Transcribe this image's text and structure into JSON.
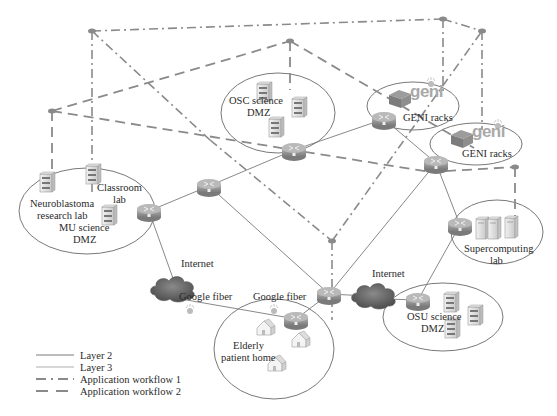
{
  "diagram": {
    "sites": {
      "osc": {
        "line1": "OSC science",
        "line2": "DMZ"
      },
      "geni_top": {
        "label": "GENI racks",
        "logo": "geni"
      },
      "geni_right": {
        "label": "GENI racks",
        "logo": "geni"
      },
      "mu_classroom": {
        "line1": "Classroom",
        "line2": "lab"
      },
      "mu_neuro": {
        "line1": "Neuroblastoma",
        "line2": "research lab"
      },
      "mu_dmz": {
        "line1": "MU science",
        "line2": "DMZ"
      },
      "supercomputing": {
        "line1": "Supercomputing",
        "line2": "lab"
      },
      "osu": {
        "line1": "OSU science",
        "line2": "DMZ"
      },
      "elderly": {
        "line1": "Elderly",
        "line2": "patient home"
      }
    },
    "clouds": {
      "internet_left": "Internet",
      "internet_right": "Internet"
    },
    "links": {
      "google_fiber_left": "Google fiber",
      "google_fiber_right": "Google fiber"
    },
    "icons": {
      "router": "router-icon",
      "server": "server-icon",
      "cloud": "cloud-icon",
      "house": "house-icon",
      "geni_rack": "geni-rack-icon",
      "sensor": "sensor-icon"
    },
    "colors": {
      "line": "#8a8a8a",
      "router": "#9a9a9a",
      "cloud": "#6f6f6f",
      "text": "#2a2a2a"
    }
  },
  "legend": {
    "items": [
      {
        "label": "Layer 2",
        "style": "solid"
      },
      {
        "label": "Layer 3",
        "style": "solid-thin"
      },
      {
        "label": "Application workflow 1",
        "style": "dash-dot"
      },
      {
        "label": "Application workflow 2",
        "style": "dashed"
      }
    ]
  }
}
